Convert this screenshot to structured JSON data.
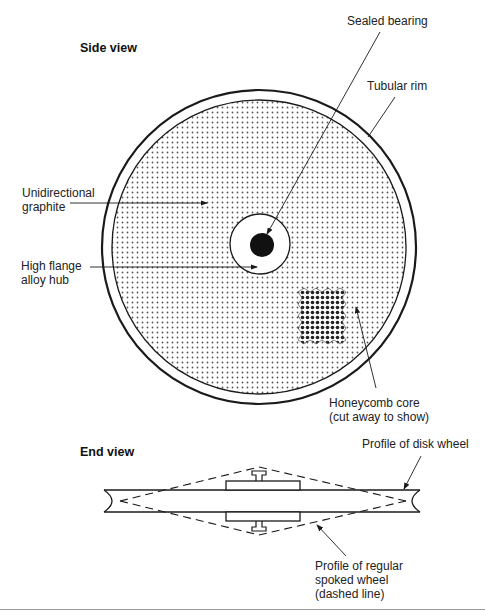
{
  "side_view": {
    "title": "Side view",
    "labels": {
      "sealed_bearing": "Sealed bearing",
      "tubular_rim": "Tubular rim",
      "unidirectional_graphite": "Unidirectional\ngraphite",
      "high_flange_hub": "High flange\nalloy hub",
      "honeycomb_core": "Honeycomb core\n(cut away to show)"
    }
  },
  "end_view": {
    "title": "End view",
    "labels": {
      "disk_profile": "Profile of disk wheel",
      "spoked_profile": "Profile of regular\nspoked wheel\n(dashed line)"
    }
  },
  "colors": {
    "line": "#1a1a1a",
    "graphite_dot": "#555555",
    "honeycomb_dot": "#222222",
    "rule": "#999999"
  }
}
